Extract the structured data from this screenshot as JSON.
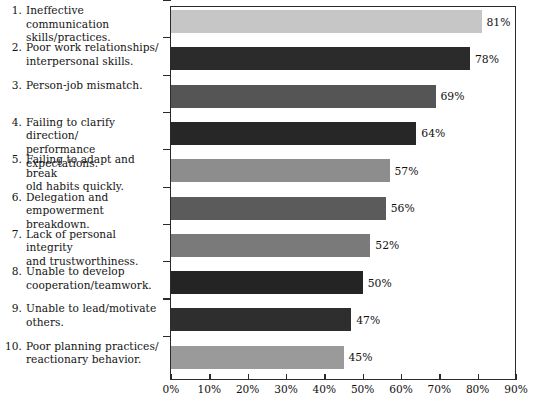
{
  "chart_data": {
    "type": "bar",
    "orientation": "horizontal",
    "title": "",
    "subtitle": "",
    "xlabel": "",
    "ylabel": "",
    "xlim": [
      0,
      90
    ],
    "grid": false,
    "legend": null,
    "xticks": [
      "0%",
      "10%",
      "20%",
      "30%",
      "40%",
      "50%",
      "60%",
      "70%",
      "80%",
      "90%"
    ],
    "xtick_values": [
      0,
      10,
      20,
      30,
      40,
      50,
      60,
      70,
      80,
      90
    ],
    "categories": [
      "Ineffective communication\nskills/practices.",
      "Poor work relationships/\ninterpersonal skills.",
      "Person-job mismatch.",
      "Failing to clarify direction/\nperformance expectations.",
      "Failing to adapt and break\nold habits quickly.",
      "Delegation and\nempowerment breakdown.",
      "Lack of personal integrity\nand trustworthiness.",
      "Unable to develop\ncooperation/teamwork.",
      "Unable to lead/motivate\nothers.",
      "Poor planning practices/\nreactionary behavior."
    ],
    "category_numbers": [
      "1.",
      "2.",
      "3.",
      "4.",
      "5.",
      "6.",
      "7.",
      "8.",
      "9.",
      "10."
    ],
    "values": [
      81,
      78,
      69,
      64,
      57,
      56,
      52,
      50,
      47,
      45
    ],
    "value_labels": [
      "81%",
      "78%",
      "69%",
      "64%",
      "57%",
      "56%",
      "52%",
      "50%",
      "47%",
      "45%"
    ],
    "bar_colors": [
      "#c6c6c6",
      "#2b2b2b",
      "#555555",
      "#272727",
      "#8d8d8d",
      "#5b5b5b",
      "#7a7a7a",
      "#242424",
      "#2e2e2e",
      "#9a9a9a"
    ],
    "axis_color": "#2a2a2a",
    "background_color": "#ffffff",
    "text_color": "#141414"
  }
}
